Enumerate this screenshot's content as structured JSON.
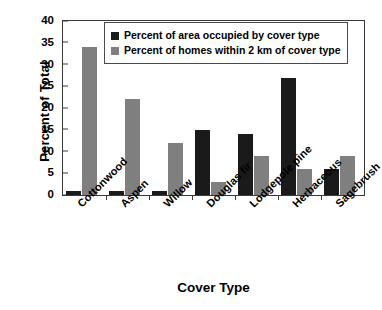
{
  "chart_data": {
    "type": "bar",
    "title": "",
    "xlabel": "Cover Type",
    "ylabel": "Percent of Total",
    "ylim": [
      0,
      40
    ],
    "ytick_values": [
      40,
      35,
      30,
      25,
      20,
      15,
      10,
      5,
      0
    ],
    "ytick_labels": [
      "40",
      "35",
      "30",
      "25",
      "20",
      "15",
      "10",
      "5",
      "0"
    ],
    "grid": false,
    "legend_position": "top-center",
    "categories": [
      "Cottonwood",
      "Aspen",
      "Willow",
      "Douglas fir",
      "Lodgepole pine",
      "Herbaceous",
      "Sagebrush"
    ],
    "series": [
      {
        "name": "Percent of area occupied by cover type",
        "color": "#1a1a1a",
        "values": [
          1,
          1,
          1,
          15,
          14,
          27,
          6
        ]
      },
      {
        "name": "Percent of homes within 2 km of cover type",
        "color": "#7f7f7f",
        "values": [
          34,
          22,
          12,
          3,
          9,
          6,
          9
        ]
      }
    ]
  },
  "legend": {
    "entries": [
      {
        "label": "Percent of area occupied by cover type",
        "swatch": "dark-swatch-icon"
      },
      {
        "label": "Percent of homes within 2 km of cover type",
        "swatch": "gray-swatch-icon"
      }
    ]
  }
}
